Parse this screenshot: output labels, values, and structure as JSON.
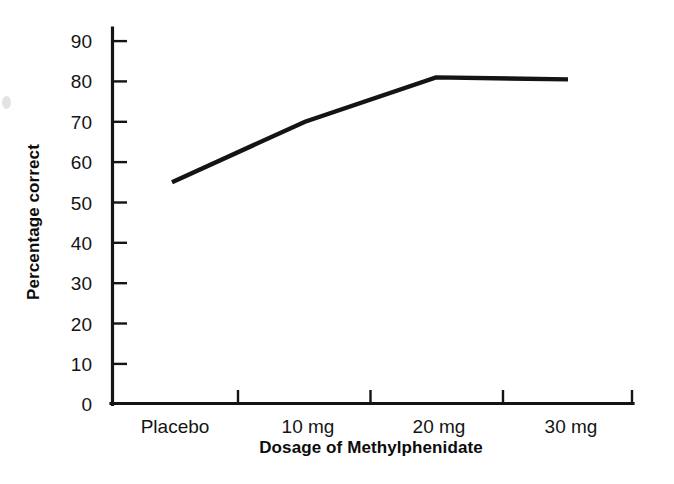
{
  "chart_data": {
    "type": "line",
    "title": "",
    "xlabel": "Dosage of Methylphenidate",
    "ylabel": "Percentage correct",
    "categories": [
      "Placebo",
      "10 mg",
      "20 mg",
      "30 mg"
    ],
    "values": [
      55,
      70,
      81,
      80.5
    ],
    "series": [
      {
        "name": "Percentage correct",
        "values": [
          55,
          70,
          81,
          80.5
        ]
      }
    ],
    "ylim": [
      0,
      90
    ],
    "ytick_step": 10,
    "yticks": [
      0,
      10,
      20,
      30,
      40,
      50,
      60,
      70,
      80,
      90
    ],
    "ytick_labels": [
      "0",
      "10",
      "20",
      "30",
      "40",
      "50",
      "60",
      "70",
      "80",
      "90"
    ],
    "xtick_labels": [
      "Placebo",
      "10 mg",
      "20 mg",
      "30 mg"
    ],
    "grid": false,
    "legend": false,
    "legend_position": "none",
    "line_color": "#141414",
    "axis_color": "#141414",
    "background_color": "#ffffff",
    "tick_direction": "inward",
    "annotations": []
  }
}
